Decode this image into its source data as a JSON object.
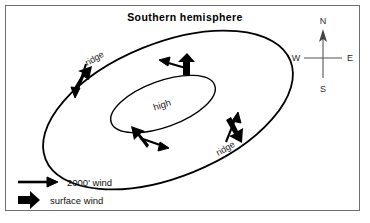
{
  "figure": {
    "title": "Southern hemisphere",
    "background_color": "#ffffff",
    "frame_color": "#6e6e6e",
    "ink_color": "#000000"
  },
  "pressure_system": {
    "center_label": "high",
    "outer_contour_name": "outer-isobar",
    "inner_contour_name": "inner-isobar"
  },
  "ridge_labels": {
    "upper_left": "ridge",
    "lower_right": "ridge"
  },
  "compass": {
    "north": "N",
    "east": "E",
    "south": "S",
    "west": "W"
  },
  "legend": {
    "items": [
      {
        "label": "2000' wind",
        "arrow": "thin-long-arrow"
      },
      {
        "label": "surface wind",
        "arrow": "thick-short-arrow"
      }
    ]
  },
  "wind_arrows": [
    {
      "location": "upper-left-ridge",
      "gradient_wind": "2000' wind",
      "surface_wind": "surface wind"
    },
    {
      "location": "north-of-high",
      "gradient_wind": "2000' wind",
      "surface_wind": "surface wind"
    },
    {
      "location": "south-of-high",
      "gradient_wind": "2000' wind",
      "surface_wind": "surface wind"
    },
    {
      "location": "lower-right-ridge",
      "gradient_wind": "2000' wind",
      "surface_wind": "surface wind"
    }
  ]
}
